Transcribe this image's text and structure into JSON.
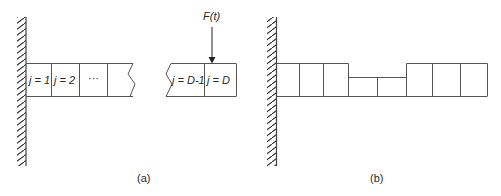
{
  "panel_a": {
    "caption": "(a)",
    "force_label": "F(t)",
    "cells": [
      {
        "label": "j = 1"
      },
      {
        "label": "j = 2"
      },
      {
        "label": "···"
      },
      {
        "label": ""
      }
    ],
    "end_cells": [
      {
        "label": "j = D-1"
      },
      {
        "label": "j = D"
      }
    ]
  },
  "panel_b": {
    "caption": "(b)",
    "cell_heights": [
      "tall",
      "tall",
      "tall",
      "short",
      "short",
      "tall",
      "tall",
      "tall"
    ]
  },
  "colors": {
    "line": "#555555",
    "text": "#2a2a2a",
    "background": "#ffffff"
  }
}
